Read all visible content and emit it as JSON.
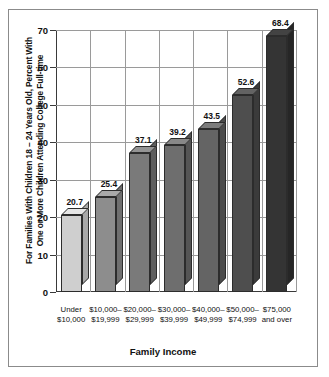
{
  "chart_data": {
    "type": "bar",
    "title": "",
    "xlabel": "Family Income",
    "ylabel": "For Families With Children 18 – 24 Years Old, Percent With One or More Children Attending College Full-time",
    "ylabel_lines": [
      "For Families With Children 18 – 24 Years Old, Percent With",
      "One or More Children Attending College Full-time"
    ],
    "categories": [
      "Under $10,000",
      "$10,000–$19,999",
      "$20,000–$29,999",
      "$30,000–$39,999",
      "$40,000–$49,999",
      "$50,000–$74,999",
      "$75,000 and over"
    ],
    "category_lines": [
      [
        "Under",
        "$10,000"
      ],
      [
        "$10,000–",
        "$19,999"
      ],
      [
        "$20,000–",
        "$29,999"
      ],
      [
        "$30,000–",
        "$39,999"
      ],
      [
        "$40,000–",
        "$49,999"
      ],
      [
        "$50,000–",
        "$74,999"
      ],
      [
        "$75,000",
        "and over"
      ]
    ],
    "values": [
      20.7,
      25.4,
      37.1,
      39.2,
      43.5,
      52.6,
      68.4
    ],
    "value_labels": [
      "20.7",
      "25.4",
      "37.1",
      "39.2",
      "43.5",
      "52.6",
      "68.4"
    ],
    "ylim": [
      0,
      70
    ],
    "yticks": [
      0,
      10,
      20,
      30,
      40,
      50,
      60,
      70
    ],
    "ytick_labels": [
      "0",
      "10",
      "20",
      "30",
      "40",
      "50",
      "60",
      "70"
    ],
    "grid": true,
    "legend": false,
    "bar_colors": [
      "#cfcfcf",
      "#8d8d8d",
      "#7a7a7a",
      "#6e6e6e",
      "#646464",
      "#4e4e4e",
      "#343434"
    ],
    "bar_top_colors": [
      "#e6e6e6",
      "#a9a9a9",
      "#949494",
      "#888888",
      "#7c7c7c",
      "#636363",
      "#434343"
    ],
    "bar_side_colors": [
      "#a8a8a8",
      "#6f6f6f",
      "#5e5e5e",
      "#555555",
      "#4c4c4c",
      "#3b3b3b",
      "#262626"
    ]
  },
  "frame": {
    "border_color": "#8b8b8b",
    "axis_color": "#3a3a3a",
    "grid_color": "#9a9a9a"
  }
}
